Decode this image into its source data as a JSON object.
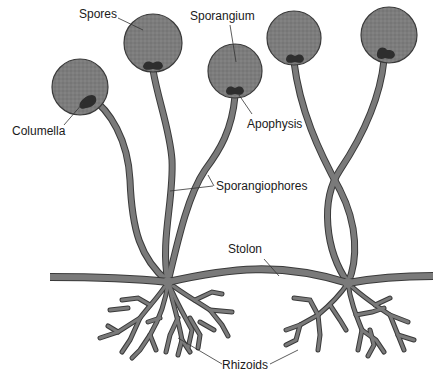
{
  "diagram": {
    "colors": {
      "hypha_fill": "#7a7a7a",
      "hypha_outline": "#3a3a3a",
      "sporangium_fill": "#7c7c7c",
      "columella_fill": "#2e2e2e",
      "leader_line": "#333333",
      "text": "#1a1a1a"
    },
    "labels": {
      "spores": "Spores",
      "sporangium": "Sporangium",
      "columella": "Columella",
      "apophysis": "Apophysis",
      "sporangiophores": "Sporangiophores",
      "stolon": "Stolon",
      "rhizoids": "Rhizoids"
    }
  }
}
